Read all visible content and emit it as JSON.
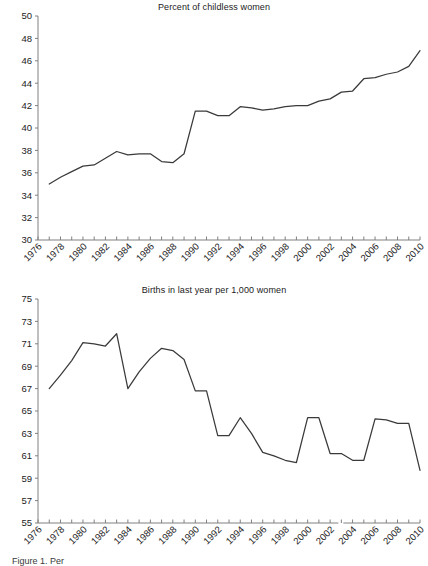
{
  "figure": {
    "width": 428,
    "height": 566,
    "background": "#ffffff",
    "line_color": "#3a3a3a",
    "axis_color": "#808080",
    "text_color": "#222222",
    "caption": "Figure 1.  Per"
  },
  "chart_data": [
    {
      "type": "line",
      "title": "Percent of childless women",
      "xlabel": "",
      "ylabel": "",
      "grid": false,
      "legend": "none",
      "xlim": [
        1976,
        2010
      ],
      "ylim": [
        30,
        50
      ],
      "ytick_step": 2,
      "xtick_step": 1,
      "xtick_label_step": 2,
      "xtick_labels": [
        "1976",
        "1978",
        "1980",
        "1982",
        "1984",
        "1986",
        "1988",
        "1990",
        "1992",
        "1994",
        "1996",
        "1998",
        "2000",
        "2002",
        "2004",
        "2006",
        "2008",
        "2010"
      ],
      "ytick_labels": [
        "30",
        "32",
        "34",
        "36",
        "38",
        "40",
        "42",
        "44",
        "46",
        "48",
        "50"
      ],
      "x": [
        1977,
        1978,
        1979,
        1980,
        1981,
        1982,
        1983,
        1984,
        1985,
        1986,
        1987,
        1988,
        1989,
        1990,
        1991,
        1992,
        1993,
        1994,
        1995,
        1996,
        1997,
        1998,
        1999,
        2000,
        2001,
        2002,
        2003,
        2004,
        2005,
        2006,
        2007,
        2008,
        2009,
        2010
      ],
      "values": [
        35.0,
        35.6,
        36.1,
        36.6,
        36.7,
        37.3,
        37.9,
        37.6,
        37.7,
        37.7,
        37.0,
        36.9,
        37.7,
        41.5,
        41.5,
        41.1,
        41.1,
        41.9,
        41.8,
        41.6,
        41.7,
        41.9,
        42.0,
        42.0,
        42.4,
        42.6,
        43.2,
        43.3,
        44.4,
        44.5,
        44.8,
        45.0,
        45.5,
        46.9
      ]
    },
    {
      "type": "line",
      "title": "Births in last year per 1,000 women",
      "xlabel": "",
      "ylabel": "",
      "grid": false,
      "legend": "none",
      "xlim": [
        1976,
        2010
      ],
      "ylim": [
        55,
        75
      ],
      "ytick_step": 2,
      "xtick_step": 1,
      "xtick_label_step": 2,
      "xtick_labels": [
        "1976",
        "1978",
        "1980",
        "1982",
        "1984",
        "1986",
        "1988",
        "1990",
        "1992",
        "1994",
        "1996",
        "1998",
        "2000",
        "2002",
        "2004",
        "2006",
        "2008",
        "2010"
      ],
      "ytick_labels": [
        "55",
        "57",
        "59",
        "61",
        "63",
        "65",
        "67",
        "69",
        "71",
        "73",
        "75"
      ],
      "x": [
        1977,
        1978,
        1979,
        1980,
        1981,
        1982,
        1983,
        1984,
        1985,
        1986,
        1987,
        1988,
        1989,
        1990,
        1991,
        1992,
        1993,
        1994,
        1995,
        1996,
        1997,
        1998,
        1999,
        2000,
        2001,
        2002,
        2003,
        2004,
        2005,
        2006,
        2007,
        2008,
        2009,
        2010
      ],
      "values": [
        67.0,
        68.2,
        69.5,
        71.1,
        71.0,
        70.8,
        71.9,
        67.0,
        68.5,
        69.7,
        70.6,
        70.4,
        69.6,
        66.8,
        66.8,
        62.8,
        62.8,
        64.4,
        63.0,
        61.3,
        61.0,
        60.6,
        60.4,
        64.4,
        64.4,
        61.2,
        61.2,
        60.6,
        60.6,
        64.3,
        64.2,
        63.9,
        63.9,
        59.7
      ],
      "axis_break_after": 2003
    }
  ]
}
